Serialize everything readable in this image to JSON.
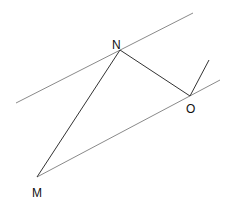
{
  "diagram": {
    "points": {
      "N": {
        "label": "N",
        "x": 120,
        "y": 50
      },
      "O": {
        "label": "O",
        "x": 190,
        "y": 96
      },
      "M": {
        "label": "M",
        "x": 37,
        "y": 177
      }
    },
    "labels": {
      "N": "N",
      "O": "O",
      "M": "M"
    },
    "colors": {
      "parallel_line": "#888888",
      "segment": "#333333"
    }
  }
}
